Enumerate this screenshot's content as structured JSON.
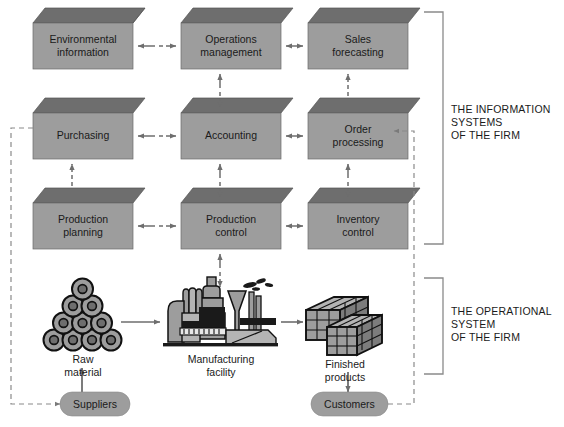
{
  "diagram": {
    "colors": {
      "box_front": "#9d9d9d",
      "box_top": "#6e6e6e",
      "box_stroke": "#5a5a5a",
      "pill_fill": "#9d9d9d",
      "arrow_solid": "#5c5c5c",
      "arrow_dashed": "#6e6e6e",
      "bracket": "#8a8a8a",
      "text": "#1a1a1a",
      "background": "#ffffff"
    },
    "boxes": [
      {
        "id": "environmental-information",
        "label": "Environmental\ninformation",
        "x": 33,
        "y": 23,
        "w": 100,
        "h": 46
      },
      {
        "id": "operations-management",
        "label": "Operations\nmanagement",
        "x": 181,
        "y": 23,
        "w": 100,
        "h": 46
      },
      {
        "id": "sales-forecasting",
        "label": "Sales\nforecasting",
        "x": 308,
        "y": 23,
        "w": 100,
        "h": 46
      },
      {
        "id": "purchasing",
        "label": "Purchasing",
        "x": 33,
        "y": 113,
        "w": 100,
        "h": 46
      },
      {
        "id": "accounting",
        "label": "Accounting",
        "x": 181,
        "y": 113,
        "w": 100,
        "h": 46
      },
      {
        "id": "order-processing",
        "label": "Order\nprocessing",
        "x": 308,
        "y": 113,
        "w": 100,
        "h": 46
      },
      {
        "id": "production-planning",
        "label": "Production\nplanning",
        "x": 33,
        "y": 203,
        "w": 100,
        "h": 46
      },
      {
        "id": "production-control",
        "label": "Production\ncontrol",
        "x": 181,
        "y": 203,
        "w": 100,
        "h": 46
      },
      {
        "id": "inventory-control",
        "label": "Inventory\ncontrol",
        "x": 308,
        "y": 203,
        "w": 100,
        "h": 46
      }
    ],
    "operational_items": [
      {
        "id": "raw-material",
        "caption": "Raw\nmaterial"
      },
      {
        "id": "manufacturing-facility",
        "caption": "Manufacturing\nfacility"
      },
      {
        "id": "finished-products",
        "caption": "Finished\nproducts"
      }
    ],
    "pills": [
      {
        "id": "suppliers",
        "label": "Suppliers"
      },
      {
        "id": "customers",
        "label": "Customers"
      }
    ],
    "brackets": [
      {
        "id": "information-systems",
        "label": "THE INFORMATION\nSYSTEMS\nOF THE FIRM"
      },
      {
        "id": "operational-system",
        "label": "THE OPERATIONAL\nSYSTEM\nOF THE FIRM"
      }
    ]
  }
}
